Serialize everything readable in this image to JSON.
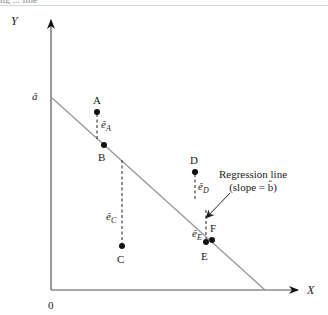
{
  "header": {
    "cropped_text": "ng ... line"
  },
  "axes": {
    "y_label": "Y",
    "x_label": "X",
    "origin_label": "0",
    "intercept_label": "â"
  },
  "regression_line": {
    "label_line1": "Regression line",
    "label_line2": "(slope = b̂)"
  },
  "points": [
    {
      "name": "A",
      "residual_label": "ê",
      "residual_sub": "A"
    },
    {
      "name": "B"
    },
    {
      "name": "C",
      "residual_label": "ê",
      "residual_sub": "C"
    },
    {
      "name": "D",
      "residual_label": "ê",
      "residual_sub": "D"
    },
    {
      "name": "E",
      "residual_label": "ê",
      "residual_sub": "E"
    },
    {
      "name": "F"
    }
  ],
  "colors": {
    "axis": "#555555",
    "line": "#9a9a9a",
    "point": "#111111",
    "text": "#222222"
  }
}
